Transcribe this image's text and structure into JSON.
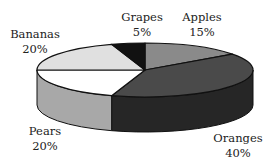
{
  "chart_data": {
    "type": "pie",
    "style": "3d",
    "title": "",
    "categories": [
      "Apples",
      "Oranges",
      "Pears",
      "Bananas",
      "Grapes"
    ],
    "values": [
      15,
      40,
      20,
      20,
      5
    ],
    "unit": "%",
    "slices": [
      {
        "label": "Apples",
        "value": 15,
        "pct_label": "15%",
        "top_color": "#8a8a8a",
        "side_color": "#6a6a6a"
      },
      {
        "label": "Oranges",
        "value": 40,
        "pct_label": "40%",
        "top_color": "#4a4a4a",
        "side_color": "#262626"
      },
      {
        "label": "Pears",
        "value": 20,
        "pct_label": "20%",
        "top_color": "#ffffff",
        "side_color": "#a8a8a8"
      },
      {
        "label": "Bananas",
        "value": 20,
        "pct_label": "20%",
        "top_color": "#e0e0e0",
        "side_color": "#c0c0c0"
      },
      {
        "label": "Grapes",
        "value": 5,
        "pct_label": "5%",
        "top_color": "#111111",
        "side_color": "#000000"
      }
    ],
    "start_angle_deg": 90,
    "direction": "clockwise",
    "legend": "none",
    "data_labels": "outside, name and percent"
  },
  "labels": {
    "apples": {
      "name": "Apples",
      "pct": "15%"
    },
    "oranges": {
      "name": "Oranges",
      "pct": "40%"
    },
    "pears": {
      "name": "Pears",
      "pct": "20%"
    },
    "bananas": {
      "name": "Bananas",
      "pct": "20%"
    },
    "grapes": {
      "name": "Grapes",
      "pct": "5%"
    }
  }
}
